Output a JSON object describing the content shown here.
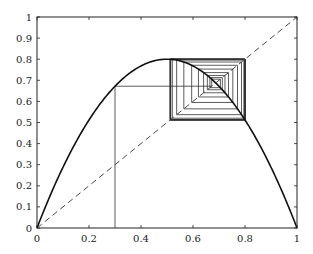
{
  "chart_data": {
    "type": "line",
    "title": "",
    "xlabel": "",
    "ylabel": "",
    "xlim": [
      0,
      1
    ],
    "ylim": [
      0,
      1
    ],
    "grid": false,
    "legend": null,
    "x_ticks": [
      "0",
      "0.2",
      "0.4",
      "0.6",
      "0.8",
      "1"
    ],
    "x_tick_values": [
      0,
      0.2,
      0.4,
      0.6,
      0.8,
      1
    ],
    "y_ticks": [
      "0",
      "0.1",
      "0.2",
      "0.3",
      "0.4",
      "0.5",
      "0.6",
      "0.7",
      "0.8",
      "0.9",
      "1"
    ],
    "y_tick_values": [
      0,
      0.1,
      0.2,
      0.3,
      0.4,
      0.5,
      0.6,
      0.7,
      0.8,
      0.9,
      1
    ],
    "series": [
      {
        "name": "logistic map f(x) = r x (1 - x)",
        "style": "solid-thick",
        "r": 3.2,
        "peak": [
          0.5,
          0.8
        ]
      },
      {
        "name": "diagonal y = x",
        "style": "dashed",
        "x": [
          0,
          1
        ],
        "y": [
          0,
          1
        ]
      },
      {
        "name": "cobweb iteration",
        "style": "solid-thin",
        "x0": 0.3,
        "iterations": 40,
        "first_value": 0.672,
        "attractor_2cycle": [
          0.513,
          0.7995
        ],
        "fixed_point": 0.6875
      }
    ]
  }
}
